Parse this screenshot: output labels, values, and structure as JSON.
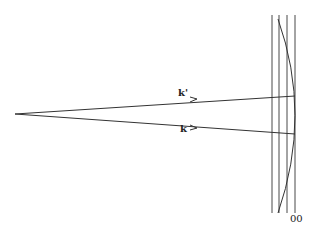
{
  "diagram": {
    "type": "ray-diagram",
    "vertex": {
      "x": 15,
      "y": 114
    },
    "rays": [
      {
        "label": "k'",
        "end": {
          "x": 295,
          "y": 96
        },
        "label_pos": {
          "x": 179,
          "y": 92
        }
      },
      {
        "label": "k",
        "end": {
          "x": 295,
          "y": 134
        },
        "label_pos": {
          "x": 179,
          "y": 127
        }
      }
    ],
    "vertical_lines_x": [
      272,
      279,
      287,
      295
    ],
    "vertical_top": 15,
    "vertical_bottom": 213,
    "sphere_arc": {
      "top": {
        "x": 278,
        "y": 20
      },
      "touch": {
        "x": 295,
        "y": 110
      },
      "bottom": {
        "x": 278,
        "y": 213
      }
    },
    "axis_label": "00",
    "axis_label_pos": {
      "x": 290,
      "y": 215
    },
    "stroke_color": "#333333"
  }
}
